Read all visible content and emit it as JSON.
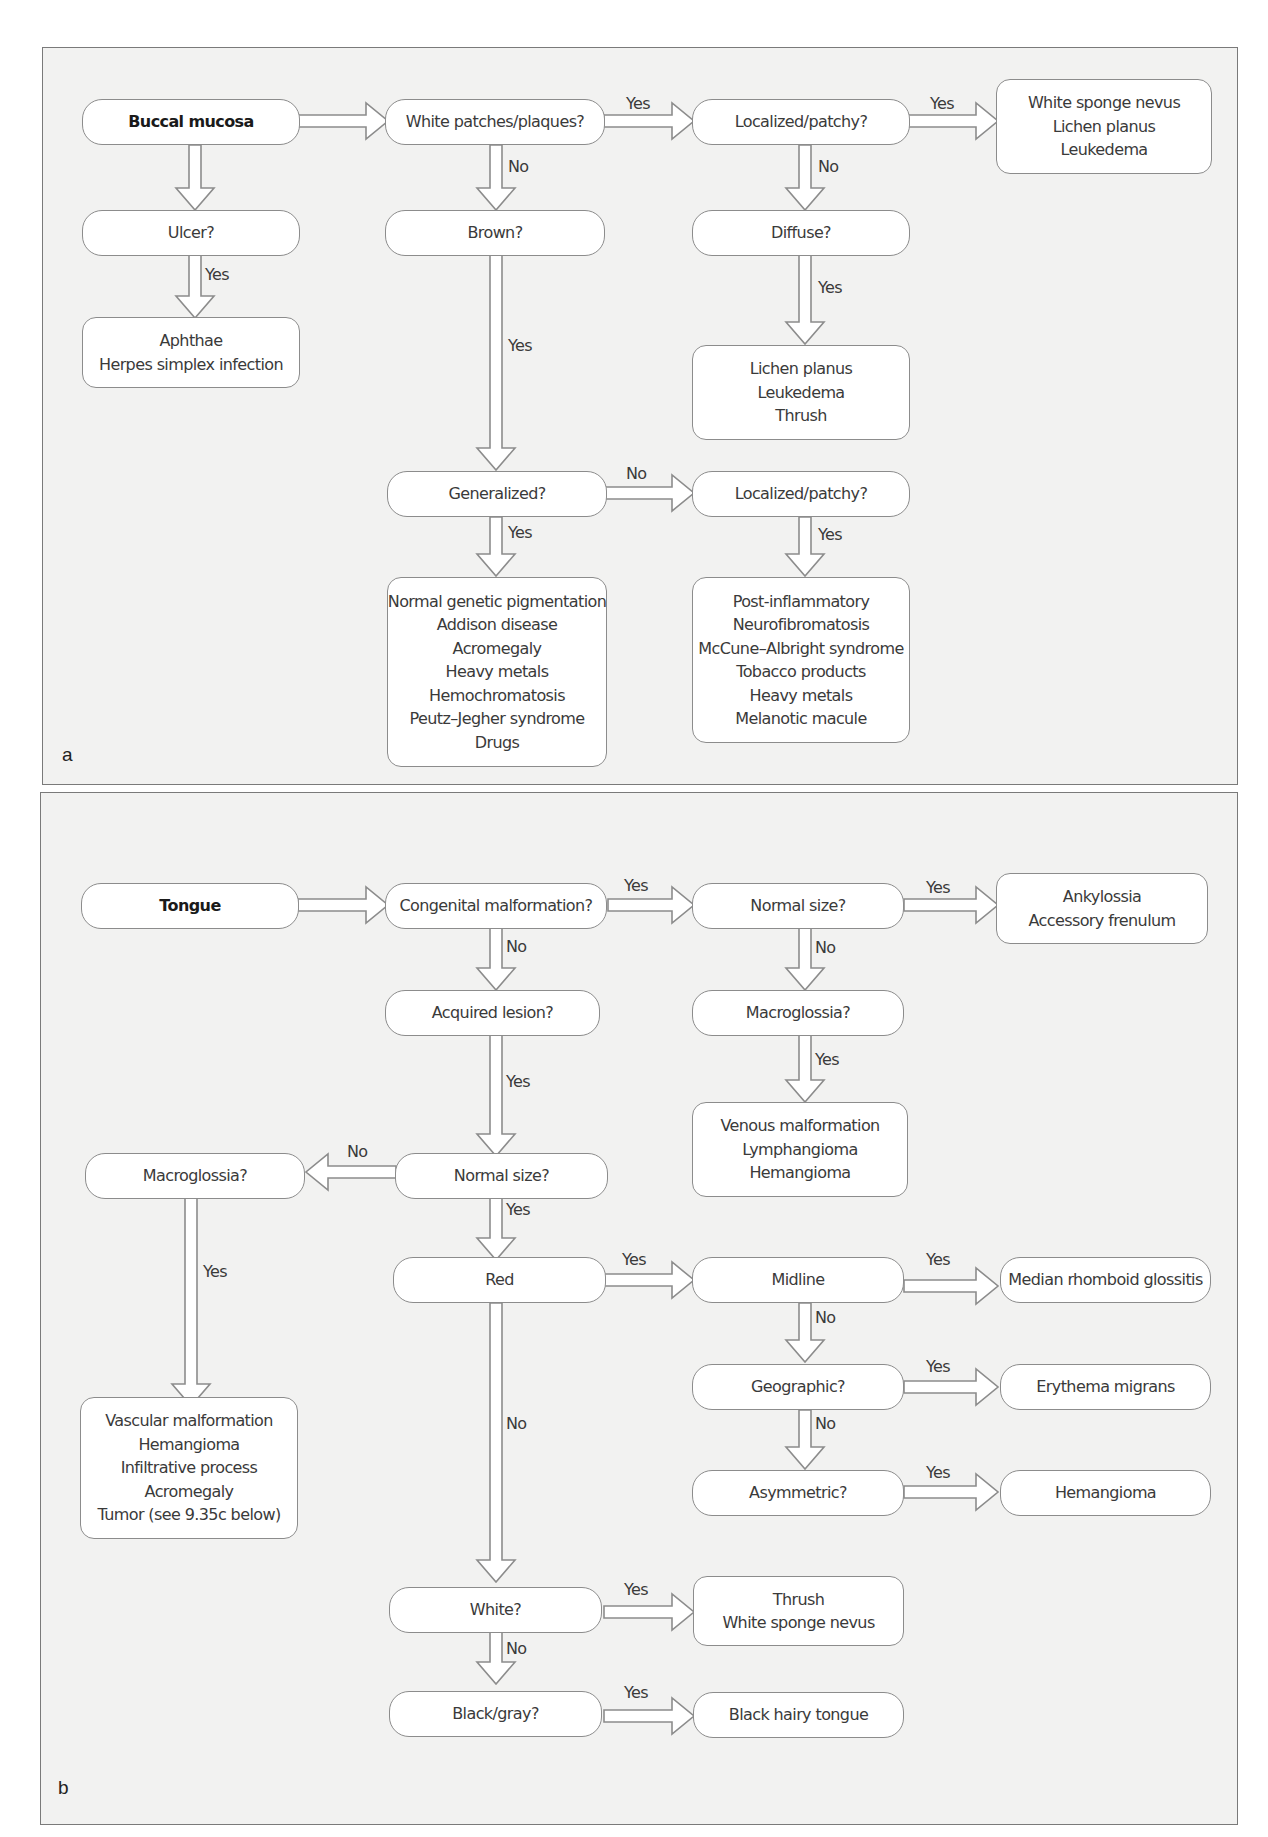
{
  "panels": {
    "a": {
      "letter": "a",
      "start": "Buccal mucosa",
      "q_white_patches": "White patches/plaques?",
      "q_localized_1": "Localized/patchy?",
      "r_localized_1": [
        "White sponge nevus",
        "Lichen planus",
        "Leukedema"
      ],
      "q_ulcer": "Ulcer?",
      "r_ulcer": [
        "Aphthae",
        "Herpes simplex infection"
      ],
      "q_brown": "Brown?",
      "q_diffuse": "Diffuse?",
      "r_diffuse": [
        "Lichen planus",
        "Leukedema",
        "Thrush"
      ],
      "q_generalized": "Generalized?",
      "q_localized_2": "Localized/patchy?",
      "r_generalized": [
        "Normal genetic pigmentation",
        "Addison disease",
        "Acromegaly",
        "Heavy metals",
        "Hemochromatosis",
        "Peutz–Jegher syndrome",
        "Drugs"
      ],
      "r_localized_2": [
        "Post-inflammatory",
        "Neurofibromatosis",
        "McCune–Albright syndrome",
        "Tobacco products",
        "Heavy metals",
        "Melanotic macule"
      ],
      "edge_labels": {
        "white_yes": "Yes",
        "white_no": "No",
        "loc1_yes": "Yes",
        "loc1_no": "No",
        "ulcer_yes": "Yes",
        "brown_yes": "Yes",
        "diffuse_yes": "Yes",
        "gen_no": "No",
        "gen_yes": "Yes",
        "loc2_yes": "Yes"
      }
    },
    "b": {
      "letter": "b",
      "start": "Tongue",
      "q_congenital": "Congenital malformation?",
      "q_normal_size_1": "Normal size?",
      "r_normal_size_1": [
        "Ankylossia",
        "Accessory frenulum"
      ],
      "q_acquired": "Acquired lesion?",
      "q_macroglossia_1": "Macroglossia?",
      "r_macroglossia_1": [
        "Venous malformation",
        "Lymphangioma",
        "Hemangioma"
      ],
      "q_macroglossia_2": "Macroglossia?",
      "q_normal_size_2": "Normal size?",
      "r_macroglossia_2": [
        "Vascular malformation",
        "Hemangioma",
        "Infiltrative process",
        "Acromegaly",
        "Tumor (see 9.35c below)"
      ],
      "q_red": "Red",
      "q_midline": "Midline",
      "r_midline": "Median rhomboid glossitis",
      "q_geographic": "Geographic?",
      "r_geographic": "Erythema migrans",
      "q_asymmetric": "Asymmetric?",
      "r_asymmetric": "Hemangioma",
      "q_white": "White?",
      "r_white": [
        "Thrush",
        "White sponge nevus"
      ],
      "q_black": "Black/gray?",
      "r_black": "Black hairy tongue",
      "edge_labels": {
        "cong_yes": "Yes",
        "cong_no": "No",
        "ns1_yes": "Yes",
        "ns1_no": "No",
        "macro1_yes": "Yes",
        "acq_yes": "Yes",
        "ns2_no": "No",
        "ns2_yes": "Yes",
        "macro2_yes": "Yes",
        "red_yes": "Yes",
        "red_no": "No",
        "mid_yes": "Yes",
        "mid_no": "No",
        "geo_yes": "Yes",
        "geo_no": "No",
        "asym_yes": "Yes",
        "white_yes": "Yes",
        "white_no": "No",
        "black_yes": "Yes"
      }
    }
  },
  "colors": {
    "panel_bg": "#f2f2f1",
    "panel_border": "#7a7a7a",
    "node_bg": "#ffffff",
    "node_border": "#8c8c8c",
    "arrow_stroke": "#8c8c8c",
    "text": "#3a3a3a"
  }
}
